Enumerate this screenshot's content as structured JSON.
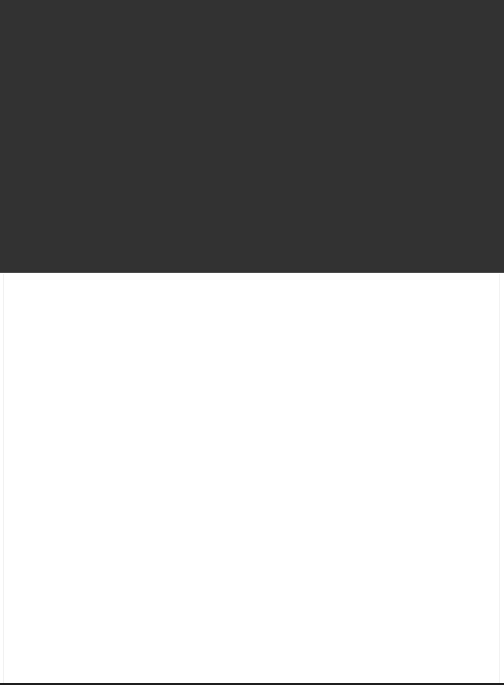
{
  "window": {
    "width": 504,
    "height": 685,
    "background_color": "#ffffff"
  },
  "header_band": {
    "name": "dark-header-band",
    "color": "#323232",
    "seam_color": "#4a4a4a",
    "height": 273,
    "label": ""
  },
  "content_pane": {
    "name": "empty-content-pane",
    "color": "#ffffff",
    "height": 412,
    "label": "",
    "body_text": ""
  },
  "rules": {
    "left_color": "#f1f1f1",
    "right_color": "#f2f2f2",
    "bottom_color": "#1f1f1f"
  }
}
